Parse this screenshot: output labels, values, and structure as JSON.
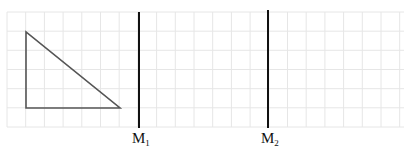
{
  "diagram": {
    "grid": {
      "x_start": 7,
      "x_end": 404,
      "y_start": 12,
      "y_end": 127,
      "cell": 18.7,
      "rows": 6,
      "line_color": "#e6e6e6"
    },
    "triangle": {
      "points": [
        [
          26,
          32
        ],
        [
          26,
          108
        ],
        [
          120,
          108
        ]
      ],
      "stroke": "#555555"
    },
    "mirrors": [
      {
        "name": "M",
        "sub": "1",
        "x": 139,
        "y1": 12,
        "y2": 128,
        "label_x": 132,
        "label_y": 131
      },
      {
        "name": "M",
        "sub": "2",
        "x": 268,
        "y1": 10,
        "y2": 128,
        "label_x": 261,
        "label_y": 131
      }
    ],
    "mirror_color": "#111111"
  }
}
